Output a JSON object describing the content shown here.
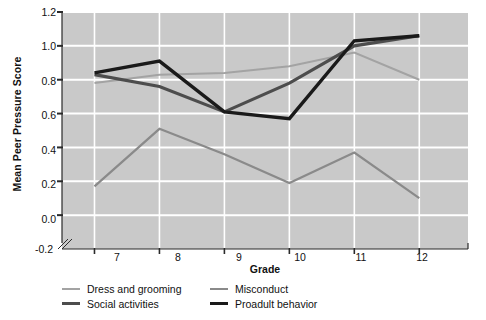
{
  "chart_data": {
    "type": "line",
    "title": "",
    "xlabel": "Grade",
    "ylabel": "Mean Peer Pressure Score",
    "categories": [
      "7",
      "8",
      "9",
      "10",
      "11",
      "12"
    ],
    "x": [
      7,
      8,
      9,
      10,
      11,
      12
    ],
    "xlim": [
      6.5,
      12.75
    ],
    "ylim": [
      -0.2,
      1.2
    ],
    "yticks": [
      "1.2",
      "1.0",
      "0.8",
      "0.6",
      "0.4",
      "0.2",
      "0.0",
      "-0.2"
    ],
    "ytick_values": [
      1.2,
      1.0,
      0.8,
      0.6,
      0.4,
      0.2,
      0.0,
      -0.2
    ],
    "grid": true,
    "grid_color": "#ffffff",
    "plot_background": "#c9c9c9",
    "axis_break": true,
    "legend_position": "below-plot",
    "series": [
      {
        "name": "Dress and grooming",
        "color": "#a3a3a3",
        "width": 2.0,
        "values": [
          0.78,
          0.83,
          0.84,
          0.88,
          0.96,
          0.8
        ]
      },
      {
        "name": "Social activities",
        "color": "#4d4d4d",
        "width": 3.2,
        "values": [
          0.83,
          0.76,
          0.61,
          0.78,
          1.0,
          1.06
        ]
      },
      {
        "name": "Misconduct",
        "color": "#8a8a8a",
        "width": 2.2,
        "values": [
          0.17,
          0.51,
          0.36,
          0.19,
          0.37,
          0.1
        ]
      },
      {
        "name": "Proadult behavior",
        "color": "#1a1a1a",
        "width": 3.4,
        "values": [
          0.84,
          0.91,
          0.61,
          0.57,
          1.03,
          1.06
        ]
      }
    ]
  },
  "legend": {
    "entries": [
      {
        "label": "Dress and grooming",
        "color": "#a3a3a3",
        "thickness": "2px"
      },
      {
        "label": "Social activities",
        "color": "#4d4d4d",
        "thickness": "3px"
      },
      {
        "label": "Misconduct",
        "color": "#8a8a8a",
        "thickness": "2px"
      },
      {
        "label": "Proadult behavior",
        "color": "#1a1a1a",
        "thickness": "3px"
      }
    ]
  }
}
